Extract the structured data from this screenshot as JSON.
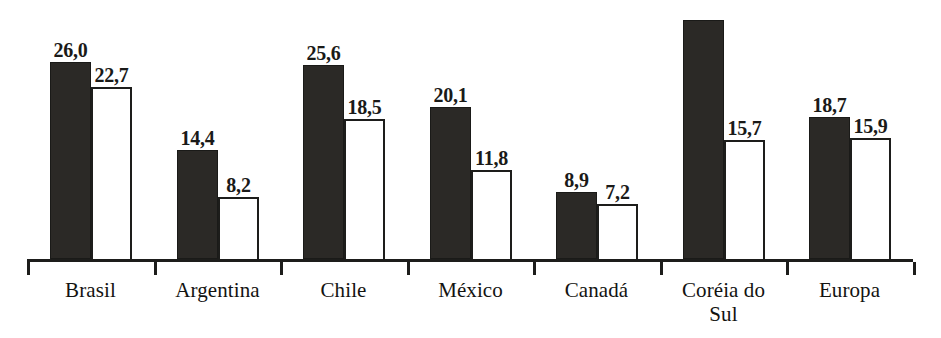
{
  "chart_data": {
    "type": "bar",
    "title": "",
    "subtitle": "",
    "xlabel": "",
    "ylabel": "",
    "grid": false,
    "legend": "none",
    "axis": {
      "baseline_visible": true,
      "y_axis_visible": false,
      "ylim": [
        0,
        33
      ],
      "tick_marks": "group separators below baseline"
    },
    "decimal_separator": ",",
    "categories": [
      "Brasil",
      "Argentina",
      "Chile",
      "México",
      "Canadá",
      "Coréia do\nSul",
      "Europa"
    ],
    "series": [
      {
        "name": "dark",
        "style": "filled-black",
        "color": "#2b2926",
        "values": [
          26.0,
          14.4,
          25.6,
          20.1,
          8.9,
          31.5,
          18.7
        ],
        "labels": [
          "26,0",
          "14,4",
          "25,6",
          "20,1",
          "8,9",
          "",
          "18,7"
        ]
      },
      {
        "name": "light",
        "style": "outlined-white",
        "color": "#ffffff",
        "values": [
          22.7,
          8.2,
          18.5,
          11.8,
          7.2,
          15.7,
          15.9
        ],
        "labels": [
          "22,7",
          "8,2",
          "18,5",
          "11,8",
          "7,2",
          "15,7",
          "15,9"
        ]
      }
    ]
  },
  "groups": [
    {
      "category": "Brasil",
      "dark": {
        "value": 26.0,
        "label": "26,0"
      },
      "light": {
        "value": 22.7,
        "label": "22,7"
      }
    },
    {
      "category": "Argentina",
      "dark": {
        "value": 14.4,
        "label": "14,4"
      },
      "light": {
        "value": 8.2,
        "label": "8,2"
      }
    },
    {
      "category": "Chile",
      "dark": {
        "value": 25.6,
        "label": "25,6"
      },
      "light": {
        "value": 18.5,
        "label": "18,5"
      }
    },
    {
      "category": "México",
      "dark": {
        "value": 20.1,
        "label": "20,1"
      },
      "light": {
        "value": 11.8,
        "label": "11,8"
      }
    },
    {
      "category": "Canadá",
      "dark": {
        "value": 8.9,
        "label": "8,9"
      },
      "light": {
        "value": 7.2,
        "label": "7,2"
      }
    },
    {
      "category": "Coréia do Sul",
      "category_display": "Coréia do\nSul",
      "dark": {
        "value": 31.5,
        "label": ""
      },
      "light": {
        "value": 15.7,
        "label": "15,7"
      }
    },
    {
      "category": "Europa",
      "dark": {
        "value": 18.7,
        "label": "18,7"
      },
      "light": {
        "value": 15.9,
        "label": "15,9"
      }
    }
  ],
  "colors": {
    "dark_bar": "#2b2926",
    "light_bar_fill": "#ffffff",
    "stroke": "#1d1d1b",
    "text": "#131311",
    "background": "#ffffff"
  }
}
